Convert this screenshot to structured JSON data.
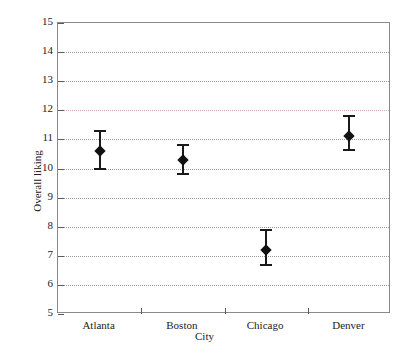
{
  "chart_data": {
    "type": "scatter",
    "title": "",
    "xlabel": "City",
    "ylabel": "Overall liking",
    "categories": [
      "Atlanta",
      "Boston",
      "Chicago",
      "Denver"
    ],
    "values": [
      10.6,
      10.3,
      7.2,
      11.1
    ],
    "error_low": [
      10.0,
      9.8,
      6.7,
      10.65
    ],
    "error_high": [
      11.3,
      10.8,
      7.9,
      11.8
    ],
    "ylim": [
      5,
      15
    ],
    "yticks": [
      5,
      6,
      7,
      8,
      9,
      10,
      11,
      12,
      13,
      14,
      15
    ],
    "ytick_labels": [
      "5",
      "6",
      "7",
      "8",
      "9",
      "10",
      "11",
      "12",
      "13",
      "14",
      "15"
    ],
    "grid": true,
    "grid_style": "dotted",
    "accent_gridline": 12,
    "legend": null,
    "series": [
      {
        "name": "Overall liking",
        "points": [
          {
            "category": "Atlanta",
            "value": 10.6,
            "low": 10.0,
            "high": 11.3
          },
          {
            "category": "Boston",
            "value": 10.3,
            "low": 9.8,
            "high": 10.8
          },
          {
            "category": "Chicago",
            "value": 7.2,
            "low": 6.7,
            "high": 7.9
          },
          {
            "category": "Denver",
            "value": 11.1,
            "low": 10.65,
            "high": 11.8
          }
        ]
      }
    ]
  },
  "colors": {
    "marker": "#111111",
    "whisker": "#1a1a1a",
    "gridline": "#9a9a9a",
    "accent_gridline": "#d8a6ac",
    "frame": "#8a8a8a",
    "text": "#222222",
    "background": "#ffffff"
  },
  "axes": {
    "y_title": "Overall liking",
    "x_title": "City"
  }
}
